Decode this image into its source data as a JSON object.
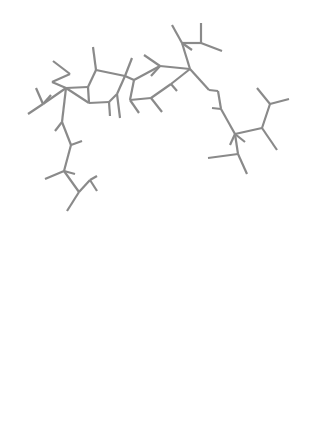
{
  "figure": {
    "panels": [
      {
        "id": "ball-and-stick",
        "style": "ball-and-stick model"
      },
      {
        "id": "vdw-surface",
        "style": "ball-and-stick with dotted van der Waals surface"
      }
    ],
    "colors": {
      "background": "#ffffff",
      "atom_dark": "#2b2b2b",
      "atom_mid": "#555555",
      "atom_light": "#9a9a9a",
      "atom_hydrogen": "#b5b5b5",
      "bond": "#8a8a8a",
      "surface_dot": "#bdbdbd"
    },
    "atoms": [
      [
        53,
        61,
        6,
        "d"
      ],
      [
        70,
        74,
        7,
        "m"
      ],
      [
        52,
        82,
        6,
        "l"
      ],
      [
        66,
        88,
        7,
        "m"
      ],
      [
        43,
        104,
        9,
        "m"
      ],
      [
        36,
        88,
        7,
        "l"
      ],
      [
        28,
        114,
        7,
        "l"
      ],
      [
        51,
        95,
        8,
        "l"
      ],
      [
        88,
        87,
        7,
        "d"
      ],
      [
        96,
        70,
        4,
        "m"
      ],
      [
        93,
        47,
        4,
        "h"
      ],
      [
        89,
        103,
        8,
        "m"
      ],
      [
        109,
        102,
        8,
        "d"
      ],
      [
        117,
        94,
        5,
        "m"
      ],
      [
        125,
        76,
        4,
        "m"
      ],
      [
        132,
        58,
        6,
        "d"
      ],
      [
        134,
        80,
        7,
        "m"
      ],
      [
        144,
        55,
        6,
        "l"
      ],
      [
        160,
        66,
        8,
        "m"
      ],
      [
        151,
        76,
        7,
        "l"
      ],
      [
        171,
        84,
        7,
        "d"
      ],
      [
        177,
        91,
        4,
        "l"
      ],
      [
        190,
        69,
        7,
        "m"
      ],
      [
        182,
        43,
        8,
        "m"
      ],
      [
        172,
        25,
        6,
        "l"
      ],
      [
        201,
        43,
        7,
        "m"
      ],
      [
        201,
        23,
        5,
        "l"
      ],
      [
        222,
        51,
        6,
        "l"
      ],
      [
        192,
        50,
        6,
        "l"
      ],
      [
        130,
        100,
        6,
        "m"
      ],
      [
        139,
        113,
        5,
        "l"
      ],
      [
        151,
        98,
        7,
        "m"
      ],
      [
        162,
        112,
        5,
        "l"
      ],
      [
        120,
        118,
        4,
        "h"
      ],
      [
        110,
        116,
        5,
        "h"
      ],
      [
        62,
        122,
        8,
        "m"
      ],
      [
        55,
        131,
        6,
        "l"
      ],
      [
        71,
        145,
        8,
        "d"
      ],
      [
        82,
        141,
        4,
        "h"
      ],
      [
        64,
        171,
        8,
        "m"
      ],
      [
        45,
        179,
        7,
        "d"
      ],
      [
        75,
        174,
        5,
        "l"
      ],
      [
        79,
        192,
        8,
        "m"
      ],
      [
        90,
        180,
        8,
        "d"
      ],
      [
        97,
        191,
        5,
        "l"
      ],
      [
        67,
        211,
        7,
        "l"
      ],
      [
        97,
        176,
        5,
        "l"
      ],
      [
        209,
        90,
        6,
        "m"
      ],
      [
        218,
        91,
        4,
        "d"
      ],
      [
        221,
        109,
        7,
        "d"
      ],
      [
        212,
        108,
        4,
        "h"
      ],
      [
        235,
        134,
        7,
        "m"
      ],
      [
        230,
        145,
        5,
        "l"
      ],
      [
        245,
        142,
        6,
        "l"
      ],
      [
        262,
        128,
        7,
        "m"
      ],
      [
        270,
        104,
        7,
        "d"
      ],
      [
        257,
        88,
        4,
        "h"
      ],
      [
        289,
        99,
        4,
        "h"
      ],
      [
        277,
        150,
        7,
        "d"
      ],
      [
        238,
        154,
        7,
        "m"
      ],
      [
        247,
        174,
        5,
        "l"
      ],
      [
        164,
        144,
        8,
        "m"
      ],
      [
        192,
        144,
        8,
        "m"
      ],
      [
        208,
        158,
        8,
        "m"
      ],
      [
        192,
        177,
        7,
        "m"
      ],
      [
        164,
        177,
        7,
        "m"
      ],
      [
        150,
        163,
        8,
        "m"
      ],
      [
        124,
        163,
        7,
        "d"
      ],
      [
        156,
        130,
        7,
        "l"
      ],
      [
        201,
        126,
        7,
        "l"
      ],
      [
        200,
        187,
        5,
        "l"
      ],
      [
        154,
        191,
        5,
        "l"
      ],
      [
        121,
        146,
        4,
        "h"
      ],
      [
        122,
        176,
        5,
        "l"
      ],
      [
        75,
        186,
        5,
        "l"
      ]
    ],
    "bonds": [
      [
        0,
        1
      ],
      [
        1,
        2
      ],
      [
        2,
        3
      ],
      [
        3,
        4
      ],
      [
        4,
        5
      ],
      [
        4,
        6
      ],
      [
        4,
        7
      ],
      [
        3,
        8
      ],
      [
        8,
        9
      ],
      [
        9,
        10
      ],
      [
        9,
        14
      ],
      [
        8,
        11
      ],
      [
        11,
        12
      ],
      [
        11,
        3
      ],
      [
        12,
        13
      ],
      [
        13,
        14
      ],
      [
        14,
        15
      ],
      [
        14,
        16
      ],
      [
        16,
        29
      ],
      [
        16,
        18
      ],
      [
        18,
        17
      ],
      [
        18,
        22
      ],
      [
        22,
        23
      ],
      [
        23,
        24
      ],
      [
        23,
        25
      ],
      [
        25,
        26
      ],
      [
        25,
        27
      ],
      [
        23,
        28
      ],
      [
        22,
        47
      ],
      [
        47,
        48
      ],
      [
        48,
        49
      ],
      [
        49,
        50
      ],
      [
        49,
        51
      ],
      [
        51,
        52
      ],
      [
        51,
        53
      ],
      [
        51,
        54
      ],
      [
        54,
        55
      ],
      [
        55,
        56
      ],
      [
        55,
        57
      ],
      [
        54,
        58
      ],
      [
        51,
        59
      ],
      [
        59,
        60
      ],
      [
        59,
        63
      ],
      [
        20,
        21
      ],
      [
        20,
        22
      ],
      [
        18,
        19
      ],
      [
        29,
        30
      ],
      [
        29,
        31
      ],
      [
        31,
        32
      ],
      [
        31,
        20
      ],
      [
        12,
        34
      ],
      [
        13,
        33
      ],
      [
        3,
        35
      ],
      [
        35,
        36
      ],
      [
        35,
        37
      ],
      [
        37,
        38
      ],
      [
        37,
        39
      ],
      [
        39,
        40
      ],
      [
        39,
        41
      ],
      [
        39,
        42
      ],
      [
        42,
        43
      ],
      [
        43,
        44
      ],
      [
        42,
        45
      ],
      [
        43,
        46
      ],
      [
        42,
        75
      ],
      [
        61,
        62
      ],
      [
        62,
        63
      ],
      [
        63,
        64
      ],
      [
        64,
        65
      ],
      [
        65,
        66
      ],
      [
        66,
        61
      ],
      [
        66,
        67
      ],
      [
        61,
        68
      ],
      [
        62,
        69
      ],
      [
        64,
        70
      ],
      [
        65,
        71
      ],
      [
        67,
        72
      ],
      [
        67,
        73
      ],
      [
        9,
        16
      ]
    ],
    "surface_clusters": [
      [
        65,
        262,
        33
      ],
      [
        40,
        290,
        30
      ],
      [
        60,
        312,
        28
      ],
      [
        110,
        265,
        34
      ],
      [
        140,
        262,
        30
      ],
      [
        175,
        238,
        28
      ],
      [
        200,
        232,
        25
      ],
      [
        208,
        262,
        25
      ],
      [
        240,
        283,
        28
      ],
      [
        268,
        310,
        26
      ],
      [
        250,
        332,
        28
      ],
      [
        215,
        330,
        34
      ],
      [
        180,
        340,
        34
      ],
      [
        150,
        345,
        34
      ],
      [
        130,
        305,
        30
      ],
      [
        85,
        340,
        34
      ],
      [
        70,
        378,
        34
      ],
      [
        100,
        390,
        30
      ],
      [
        75,
        405,
        25
      ],
      [
        180,
        382,
        30
      ],
      [
        150,
        380,
        30
      ],
      [
        215,
        380,
        28
      ],
      [
        265,
        355,
        25
      ],
      [
        40,
        330,
        28
      ],
      [
        120,
        380,
        26
      ]
    ]
  }
}
